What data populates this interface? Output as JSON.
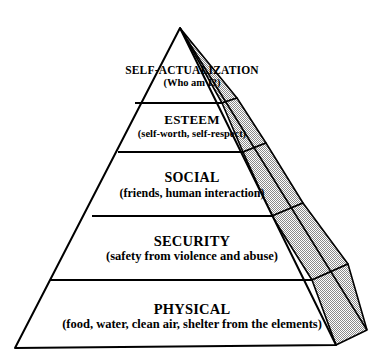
{
  "diagram": {
    "type": "pyramid",
    "background_color": "#ffffff",
    "outline_color": "#000000",
    "side_face_fill": "#c8c8c8",
    "levels": [
      {
        "rank": 5,
        "name": "SELF-ACTUALIZATION",
        "detail": "(Who am I?)"
      },
      {
        "rank": 4,
        "name": "ESTEEM",
        "detail": "(self-worth, self-respect)"
      },
      {
        "rank": 3,
        "name": "SOCIAL",
        "detail": "(friends, human interaction)"
      },
      {
        "rank": 2,
        "name": "SECURITY",
        "detail": "(safety from violence and abuse)"
      },
      {
        "rank": 1,
        "name": "PHYSICAL",
        "detail": "(food, water, clean air, shelter from the elements)"
      }
    ]
  }
}
